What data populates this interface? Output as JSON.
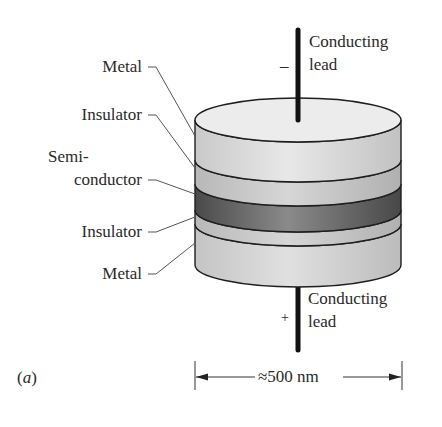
{
  "diagram": {
    "panel_label": "(a)",
    "panel_letter": "a",
    "layers_top_to_bottom": [
      {
        "name": "metal-top",
        "label": "Metal",
        "color": "#e2e2e2"
      },
      {
        "name": "insulator-top",
        "label": "Insulator",
        "color": "#cdcdcd"
      },
      {
        "name": "semiconductor",
        "label_line1": "Semi-",
        "label_line2": "conductor",
        "color": "#6e6e6e"
      },
      {
        "name": "insulator-bottom",
        "label": "Insulator",
        "color": "#c4c4c4"
      },
      {
        "name": "metal-bottom",
        "label": "Metal",
        "color": "#dadada"
      }
    ],
    "top_lead": {
      "label_line1": "Conducting",
      "label_line2": "lead",
      "polarity": "–"
    },
    "bottom_lead": {
      "label_line1": "Conducting",
      "label_line2": "lead",
      "polarity": "+"
    },
    "dimension": {
      "label": "≈500 nm"
    },
    "colors": {
      "outline": "#1e1e1e",
      "leader_line": "#555555",
      "top_face": "#ececec",
      "background": "#ffffff"
    }
  }
}
